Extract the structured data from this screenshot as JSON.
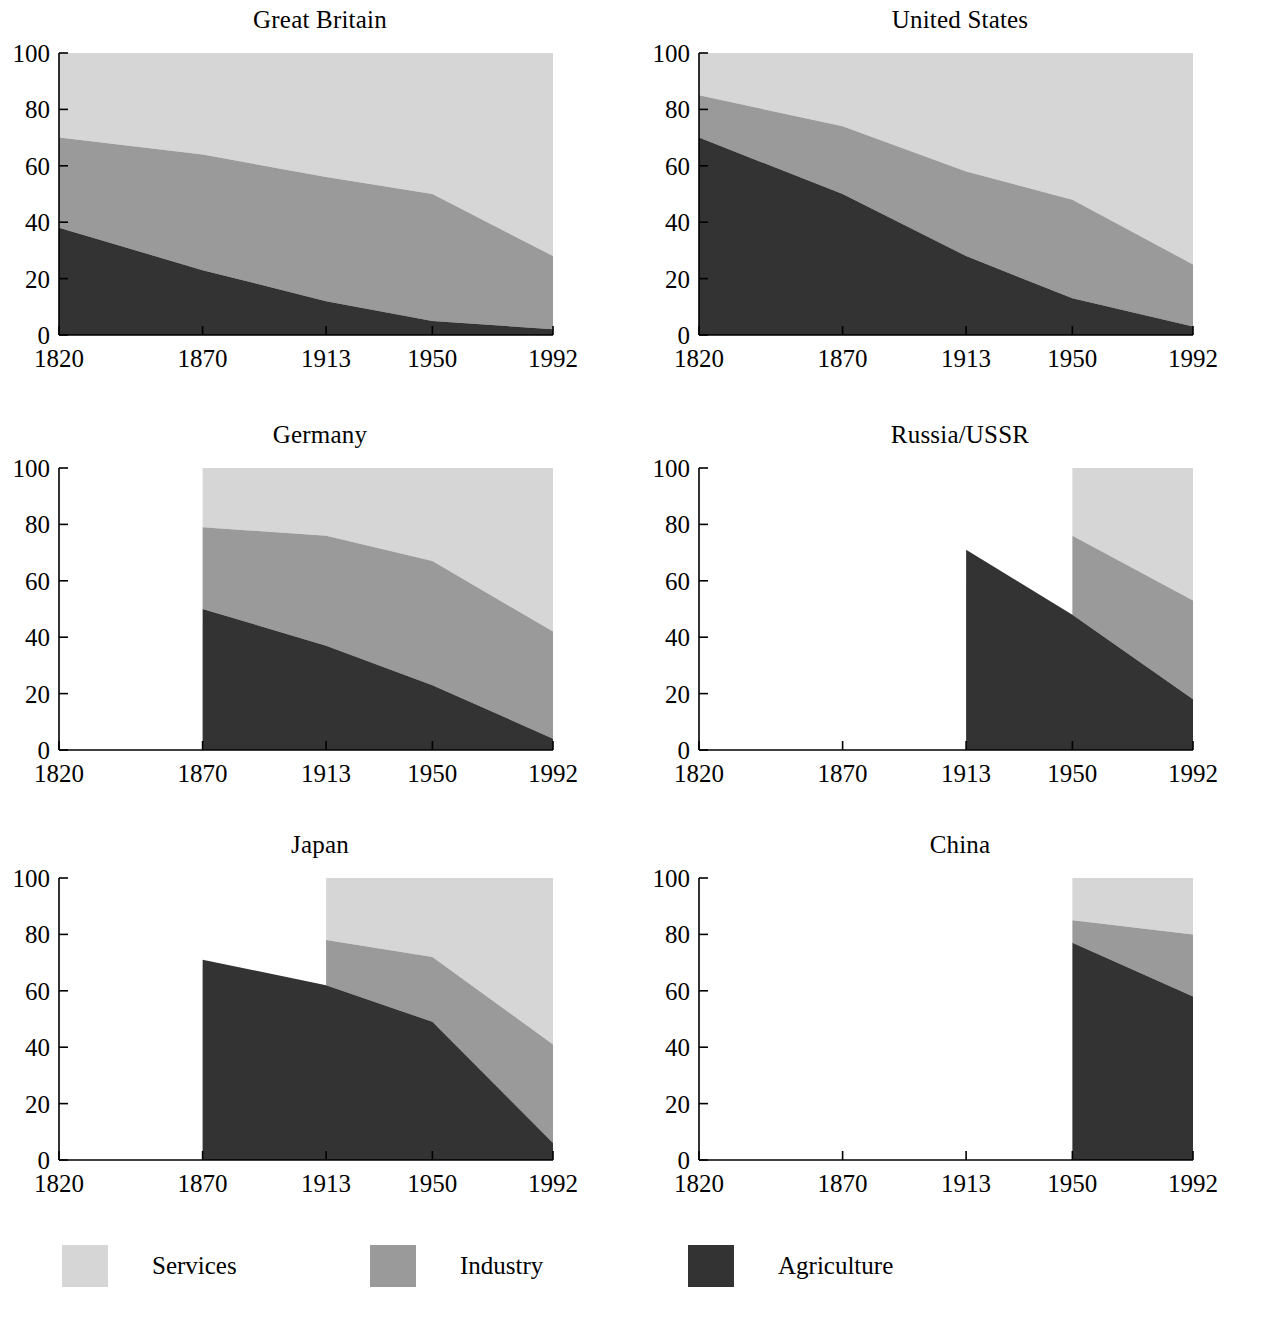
{
  "figure": {
    "title": "",
    "bottom_artifact_text": ""
  },
  "legend": {
    "position": "bottom",
    "entries": [
      {
        "label": "Services",
        "color": "#d6d6d6"
      },
      {
        "label": "Industry",
        "color": "#9a9a9a"
      },
      {
        "label": "Agriculture",
        "color": "#333333"
      }
    ]
  },
  "axis": {
    "x_ticks": [
      "1820",
      "1870",
      "1913",
      "1950",
      "1992"
    ],
    "x_tick_values": [
      1820,
      1870,
      1913,
      1950,
      1992
    ],
    "y_ticks": [
      "0",
      "20",
      "40",
      "60",
      "80",
      "100"
    ],
    "y_tick_values": [
      0,
      20,
      40,
      60,
      80,
      100
    ],
    "ylim": [
      0,
      100
    ],
    "xlim": [
      1820,
      1992
    ],
    "grid": false
  },
  "chart_data": [
    {
      "type": "area",
      "stacked": true,
      "title": "Great Britain",
      "xlabel": "",
      "ylabel": "",
      "ylim": [
        0,
        100
      ],
      "categories": [
        1820,
        1870,
        1913,
        1950,
        1992
      ],
      "x": [
        1820,
        1870,
        1913,
        1950,
        1992
      ],
      "series": [
        {
          "name": "Agriculture",
          "color": "#333333",
          "values": [
            38,
            23,
            12,
            5,
            2
          ]
        },
        {
          "name": "Industry",
          "color": "#9a9a9a",
          "values": [
            32,
            41,
            44,
            45,
            26
          ]
        },
        {
          "name": "Services",
          "color": "#d6d6d6",
          "values": [
            30,
            36,
            44,
            50,
            72
          ]
        }
      ],
      "cumulative_tops": {
        "agriculture": [
          38,
          23,
          12,
          5,
          2
        ],
        "industry": [
          70,
          64,
          56,
          50,
          28
        ],
        "services": [
          100,
          100,
          100,
          100,
          100
        ]
      }
    },
    {
      "type": "area",
      "stacked": true,
      "title": "United States",
      "xlabel": "",
      "ylabel": "",
      "ylim": [
        0,
        100
      ],
      "categories": [
        1820,
        1870,
        1913,
        1950,
        1992
      ],
      "x": [
        1820,
        1870,
        1913,
        1950,
        1992
      ],
      "series": [
        {
          "name": "Agriculture",
          "color": "#333333",
          "values": [
            70,
            50,
            28,
            13,
            3
          ]
        },
        {
          "name": "Industry",
          "color": "#9a9a9a",
          "values": [
            15,
            24,
            30,
            35,
            22
          ]
        },
        {
          "name": "Services",
          "color": "#d6d6d6",
          "values": [
            15,
            26,
            42,
            52,
            75
          ]
        }
      ],
      "cumulative_tops": {
        "agriculture": [
          70,
          50,
          28,
          13,
          3
        ],
        "industry": [
          85,
          74,
          58,
          48,
          25
        ],
        "services": [
          100,
          100,
          100,
          100,
          100
        ]
      }
    },
    {
      "type": "area",
      "stacked": true,
      "title": "Germany",
      "xlabel": "",
      "ylabel": "",
      "ylim": [
        0,
        100
      ],
      "categories": [
        1870,
        1913,
        1950,
        1992
      ],
      "x": [
        1870,
        1913,
        1950,
        1992
      ],
      "series": [
        {
          "name": "Agriculture",
          "color": "#333333",
          "values": [
            50,
            37,
            23,
            4
          ]
        },
        {
          "name": "Industry",
          "color": "#9a9a9a",
          "values": [
            29,
            39,
            44,
            38
          ]
        },
        {
          "name": "Services",
          "color": "#d6d6d6",
          "values": [
            21,
            24,
            33,
            58
          ]
        }
      ],
      "cumulative_tops": {
        "agriculture": [
          50,
          37,
          23,
          4
        ],
        "industry": [
          79,
          76,
          67,
          42
        ],
        "services": [
          100,
          100,
          100,
          100
        ]
      }
    },
    {
      "type": "area",
      "stacked": true,
      "title": "Russia/USSR",
      "xlabel": "",
      "ylabel": "",
      "ylim": [
        0,
        100
      ],
      "categories": [
        1913,
        1950,
        1992
      ],
      "x": [
        1913,
        1950,
        1992
      ],
      "series": [
        {
          "name": "Agriculture",
          "color": "#333333",
          "values": [
            71,
            48,
            18
          ]
        },
        {
          "name": "Industry",
          "color": "#9a9a9a",
          "values": [
            null,
            28,
            35
          ]
        },
        {
          "name": "Services",
          "color": "#d6d6d6",
          "values": [
            null,
            24,
            47
          ]
        }
      ],
      "cumulative_tops": {
        "agriculture": [
          71,
          48,
          18
        ],
        "industry": [
          null,
          76,
          53
        ],
        "services": [
          null,
          100,
          100
        ]
      },
      "note": "Industry and services data begin at 1950"
    },
    {
      "type": "area",
      "stacked": true,
      "title": "Japan",
      "xlabel": "",
      "ylabel": "",
      "ylim": [
        0,
        100
      ],
      "categories": [
        1870,
        1913,
        1950,
        1992
      ],
      "x": [
        1870,
        1913,
        1950,
        1992
      ],
      "series": [
        {
          "name": "Agriculture",
          "color": "#333333",
          "values": [
            71,
            62,
            49,
            6
          ]
        },
        {
          "name": "Industry",
          "color": "#9a9a9a",
          "values": [
            null,
            16,
            23,
            35
          ]
        },
        {
          "name": "Services",
          "color": "#d6d6d6",
          "values": [
            null,
            22,
            28,
            59
          ]
        }
      ],
      "cumulative_tops": {
        "agriculture": [
          71,
          62,
          49,
          6
        ],
        "industry": [
          null,
          78,
          72,
          41
        ],
        "services": [
          null,
          100,
          100,
          100
        ]
      },
      "note": "Industry and services data begin at 1913"
    },
    {
      "type": "area",
      "stacked": true,
      "title": "China",
      "xlabel": "",
      "ylabel": "",
      "ylim": [
        0,
        100
      ],
      "categories": [
        1950,
        1992
      ],
      "x": [
        1950,
        1992
      ],
      "series": [
        {
          "name": "Agriculture",
          "color": "#333333",
          "values": [
            77,
            58
          ]
        },
        {
          "name": "Industry",
          "color": "#9a9a9a",
          "values": [
            8,
            22
          ]
        },
        {
          "name": "Services",
          "color": "#d6d6d6",
          "values": [
            15,
            20
          ]
        }
      ],
      "cumulative_tops": {
        "agriculture": [
          77,
          58
        ],
        "industry": [
          85,
          80
        ],
        "services": [
          100,
          100
        ]
      }
    }
  ]
}
